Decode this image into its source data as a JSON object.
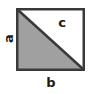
{
  "figure": {
    "type": "geometry-diagram",
    "shape": "square",
    "shaded_region": "lower-left-triangle",
    "colors": {
      "background": "#ffffff",
      "shaded_fill": "#a0a0a0",
      "unshaded_fill": "#ffffff",
      "outline": "#3a3a3a",
      "diagonal": "#3a3a3a",
      "label_text": "#1a1a1a"
    },
    "geometry": {
      "square_left": 17,
      "square_top": 9,
      "square_right": 84,
      "square_bottom": 70,
      "diagonal_from": "top-left",
      "diagonal_to": "bottom-right"
    },
    "labels": {
      "left_side": "a",
      "bottom_side": "b",
      "hypotenuse": "c"
    }
  }
}
